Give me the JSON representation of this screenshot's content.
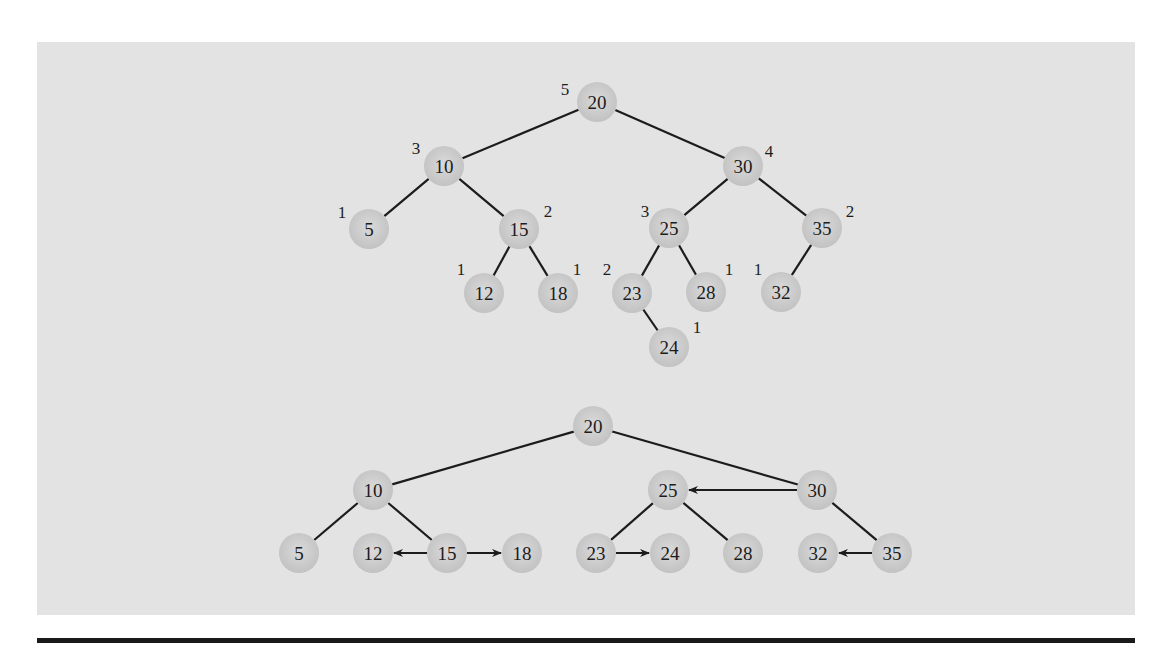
{
  "colors": {
    "background": "#ffffff",
    "panel": "#e3e3e3",
    "node_fill": "#c4c4c4",
    "node_highlight": "#dadada",
    "line": "#1c1c1c",
    "rule": "#1a1a1a"
  },
  "node_radius": 20,
  "top_tree": {
    "description": "AVL tree with node heights",
    "nodes": [
      {
        "key": "20",
        "x": 597,
        "y": 102,
        "height": "5",
        "hx": 565,
        "hy": 95
      },
      {
        "key": "10",
        "x": 444,
        "y": 166,
        "height": "3",
        "hx": 416,
        "hy": 154
      },
      {
        "key": "30",
        "x": 743,
        "y": 166,
        "height": "4",
        "hx": 769,
        "hy": 157
      },
      {
        "key": "5",
        "x": 369,
        "y": 229,
        "height": "1",
        "hx": 342,
        "hy": 218
      },
      {
        "key": "15",
        "x": 519,
        "y": 229,
        "height": "2",
        "hx": 548,
        "hy": 217
      },
      {
        "key": "25",
        "x": 669,
        "y": 228,
        "height": "3",
        "hx": 645,
        "hy": 217
      },
      {
        "key": "35",
        "x": 822,
        "y": 228,
        "height": "2",
        "hx": 850,
        "hy": 217
      },
      {
        "key": "12",
        "x": 484,
        "y": 293,
        "height": "1",
        "hx": 461,
        "hy": 275
      },
      {
        "key": "18",
        "x": 558,
        "y": 293,
        "height": "1",
        "hx": 577,
        "hy": 275
      },
      {
        "key": "23",
        "x": 632,
        "y": 293,
        "height": "2",
        "hx": 607,
        "hy": 275
      },
      {
        "key": "28",
        "x": 706,
        "y": 292,
        "height": "1",
        "hx": 729,
        "hy": 275
      },
      {
        "key": "32",
        "x": 781,
        "y": 292,
        "height": "1",
        "hx": 758,
        "hy": 275
      },
      {
        "key": "24",
        "x": 669,
        "y": 347,
        "height": "1",
        "hx": 697,
        "hy": 333
      }
    ],
    "edges": [
      [
        "20",
        "10"
      ],
      [
        "20",
        "30"
      ],
      [
        "10",
        "5"
      ],
      [
        "10",
        "15"
      ],
      [
        "15",
        "12"
      ],
      [
        "15",
        "18"
      ],
      [
        "30",
        "25"
      ],
      [
        "30",
        "35"
      ],
      [
        "25",
        "23"
      ],
      [
        "25",
        "28"
      ],
      [
        "23",
        "24"
      ],
      [
        "35",
        "32"
      ]
    ]
  },
  "bottom_tree": {
    "description": "Equivalent tree drawn with sibling arrows",
    "nodes": [
      {
        "key": "20",
        "x": 593,
        "y": 426
      },
      {
        "key": "10",
        "x": 373,
        "y": 490
      },
      {
        "key": "25",
        "x": 668,
        "y": 490
      },
      {
        "key": "30",
        "x": 817,
        "y": 490
      },
      {
        "key": "5",
        "x": 299,
        "y": 553
      },
      {
        "key": "12",
        "x": 373,
        "y": 553
      },
      {
        "key": "15",
        "x": 447,
        "y": 553
      },
      {
        "key": "18",
        "x": 522,
        "y": 553
      },
      {
        "key": "23",
        "x": 596,
        "y": 553
      },
      {
        "key": "24",
        "x": 670,
        "y": 553
      },
      {
        "key": "28",
        "x": 743,
        "y": 553
      },
      {
        "key": "32",
        "x": 818,
        "y": 553
      },
      {
        "key": "35",
        "x": 892,
        "y": 553
      }
    ],
    "edges": [
      [
        "20",
        "10"
      ],
      [
        "20",
        "30"
      ],
      [
        "10",
        "5"
      ],
      [
        "10",
        "15"
      ],
      [
        "25",
        "23"
      ],
      [
        "25",
        "28"
      ],
      [
        "30",
        "35"
      ]
    ],
    "arrows": [
      [
        "15",
        "12"
      ],
      [
        "15",
        "18"
      ],
      [
        "30",
        "25"
      ],
      [
        "23",
        "24"
      ],
      [
        "35",
        "32"
      ]
    ]
  }
}
